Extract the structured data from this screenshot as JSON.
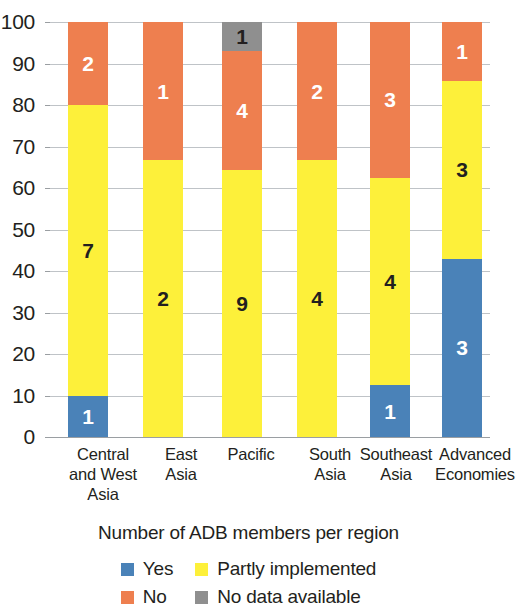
{
  "chart_data": {
    "type": "bar",
    "subtype": "stacked-percentage",
    "title": "",
    "xlabel": "",
    "ylabel": "",
    "ylim": [
      0,
      100
    ],
    "yticks": [
      0,
      10,
      20,
      30,
      40,
      50,
      60,
      70,
      80,
      90,
      100
    ],
    "grid": true,
    "legend_position": "bottom",
    "legend_title": "Number of ADB members per region",
    "categories": [
      "Central and West Asia",
      "East Asia",
      "Pacific",
      "South Asia",
      "Southeast Asia",
      "Advanced Economies"
    ],
    "category_lines": [
      [
        "Central",
        "and West",
        "Asia"
      ],
      [
        "East",
        "Asia"
      ],
      [
        "Pacific"
      ],
      [
        "South",
        "Asia"
      ],
      [
        "Southeast",
        "Asia"
      ],
      [
        "Advanced",
        "Economies"
      ]
    ],
    "series": [
      {
        "name": "Yes",
        "color": "#4a82b8",
        "label_color": "light",
        "values": [
          1,
          0,
          0,
          0,
          1,
          3
        ],
        "percent": [
          10.0,
          0.0,
          0.0,
          0.0,
          12.5,
          42.9
        ]
      },
      {
        "name": "Partly implemented",
        "color": "#fdf03a",
        "label_color": "dark",
        "values": [
          7,
          2,
          9,
          4,
          4,
          3
        ],
        "percent": [
          70.0,
          66.7,
          64.3,
          66.7,
          50.0,
          42.9
        ]
      },
      {
        "name": "No",
        "color": "#ee7f4f",
        "label_color": "light",
        "values": [
          2,
          1,
          4,
          2,
          3,
          1
        ],
        "percent": [
          20.0,
          33.3,
          28.6,
          33.3,
          37.5,
          14.2
        ]
      },
      {
        "name": "No data available",
        "color": "#8f8f8f",
        "label_color": "dark",
        "values": [
          0,
          0,
          1,
          0,
          0,
          0
        ],
        "percent": [
          0.0,
          0.0,
          7.1,
          0.0,
          0.0,
          0.0
        ]
      }
    ],
    "category_totals": [
      10,
      3,
      14,
      6,
      8,
      7
    ]
  },
  "legend": {
    "title": "Number of ADB members per region",
    "entries": [
      {
        "label": "Yes",
        "color": "#4a82b8",
        "icon": "legend-swatch-yes"
      },
      {
        "label": "Partly implemented",
        "color": "#fdf03a",
        "icon": "legend-swatch-partly-implemented"
      },
      {
        "label": "No",
        "color": "#ee7f4f",
        "icon": "legend-swatch-no"
      },
      {
        "label": "No data available",
        "color": "#8f8f8f",
        "icon": "legend-swatch-no-data-available"
      }
    ]
  }
}
